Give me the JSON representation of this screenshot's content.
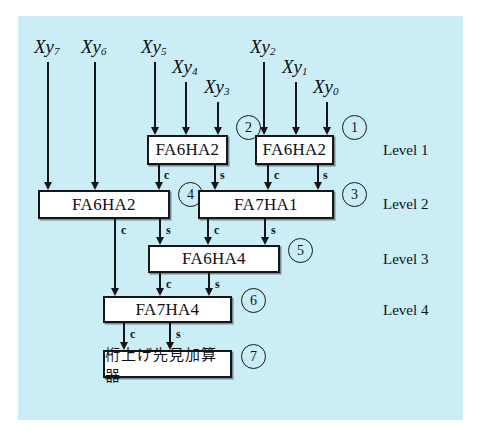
{
  "figure": {
    "background_color": "#cbeef6",
    "panel_border_color": "#ffffff",
    "line_color": "#15151a",
    "box_fill": "#ffffff"
  },
  "inputs": [
    {
      "id": "xy7",
      "label_x": "X",
      "label_y": "y",
      "sub": "7",
      "x": 48,
      "label_top": 36,
      "arrow_top": 62,
      "arrow_bottom": 190
    },
    {
      "id": "xy6",
      "label_x": "X",
      "label_y": "y",
      "sub": "6",
      "x": 95,
      "label_top": 36,
      "arrow_top": 62,
      "arrow_bottom": 190
    },
    {
      "id": "xy5",
      "label_x": "X",
      "label_y": "y",
      "sub": "5",
      "x": 155,
      "label_top": 36,
      "arrow_top": 62,
      "arrow_bottom": 135
    },
    {
      "id": "xy4",
      "label_x": "X",
      "label_y": "y",
      "sub": "4",
      "x": 186,
      "label_top": 56,
      "arrow_top": 82,
      "arrow_bottom": 135
    },
    {
      "id": "xy3",
      "label_x": "X",
      "label_y": "y",
      "sub": "3",
      "x": 218,
      "label_top": 76,
      "arrow_top": 102,
      "arrow_bottom": 135
    },
    {
      "id": "xy2",
      "label_x": "X",
      "label_y": "y",
      "sub": "2",
      "x": 264,
      "label_top": 36,
      "arrow_top": 62,
      "arrow_bottom": 135
    },
    {
      "id": "xy1",
      "label_x": "X",
      "label_y": "y",
      "sub": "1",
      "x": 296,
      "label_top": 56,
      "arrow_top": 82,
      "arrow_bottom": 135
    },
    {
      "id": "xy0",
      "label_x": "X",
      "label_y": "y",
      "sub": "0",
      "x": 327,
      "label_top": 76,
      "arrow_top": 102,
      "arrow_bottom": 135
    }
  ],
  "blocks": [
    {
      "id": "b2",
      "label": "FA6HA2",
      "left": 147,
      "top": 135,
      "width": 81,
      "height": 30,
      "marker": "②",
      "marker_left": 236,
      "marker_top": 115
    },
    {
      "id": "b1",
      "label": "FA6HA2",
      "left": 255,
      "top": 135,
      "width": 79,
      "height": 30,
      "marker": "①",
      "marker_left": 342,
      "marker_top": 115
    },
    {
      "id": "b4",
      "label": "FA6HA2",
      "left": 38,
      "top": 190,
      "width": 132,
      "height": 29,
      "marker": "④",
      "marker_left": 178,
      "marker_top": 182
    },
    {
      "id": "b3",
      "label": "FA7HA1",
      "left": 198,
      "top": 190,
      "width": 136,
      "height": 29,
      "marker": "③",
      "marker_left": 342,
      "marker_top": 182
    },
    {
      "id": "b5",
      "label": "FA6HA4",
      "left": 148,
      "top": 245,
      "width": 132,
      "height": 28,
      "marker": "⑤",
      "marker_left": 288,
      "marker_top": 238
    },
    {
      "id": "b6",
      "label": "FA7HA4",
      "left": 103,
      "top": 296,
      "width": 129,
      "height": 27,
      "marker": "⑥",
      "marker_left": 241,
      "marker_top": 288
    },
    {
      "id": "b7",
      "label": "桁上げ先見加算器",
      "left": 103,
      "top": 350,
      "width": 129,
      "height": 28,
      "marker": "⑦",
      "marker_left": 241,
      "marker_top": 344
    }
  ],
  "signal_labels": {
    "carry": "c",
    "sum": "s"
  },
  "edges": [
    {
      "from": "b2",
      "port": "c",
      "x": 159,
      "top": 165,
      "bottom": 190,
      "label": "c",
      "label_left": 164,
      "label_top": 168
    },
    {
      "from": "b2",
      "port": "s",
      "x": 215,
      "top": 165,
      "bottom": 190,
      "label": "s",
      "label_left": 220,
      "label_top": 168
    },
    {
      "from": "b1",
      "port": "c",
      "x": 268,
      "top": 165,
      "bottom": 190,
      "label": "c",
      "label_left": 274,
      "label_top": 168
    },
    {
      "from": "b1",
      "port": "s",
      "x": 318,
      "top": 165,
      "bottom": 190,
      "label": "s",
      "label_left": 323,
      "label_top": 168
    },
    {
      "from": "b4",
      "port": "c",
      "x": 115,
      "top": 219,
      "bottom": 296,
      "label": "c",
      "label_left": 121,
      "label_top": 223
    },
    {
      "from": "b4",
      "port": "s",
      "x": 160,
      "top": 219,
      "bottom": 245,
      "label": "s",
      "label_left": 166,
      "label_top": 223
    },
    {
      "from": "b3",
      "port": "c",
      "x": 208,
      "top": 219,
      "bottom": 245,
      "label": "c",
      "label_left": 214,
      "label_top": 223
    },
    {
      "from": "b3",
      "port": "s",
      "x": 265,
      "top": 219,
      "bottom": 245,
      "label": "s",
      "label_left": 271,
      "label_top": 223
    },
    {
      "from": "b5",
      "port": "c",
      "x": 160,
      "top": 273,
      "bottom": 296,
      "label": "c",
      "label_left": 166,
      "label_top": 277
    },
    {
      "from": "b5",
      "port": "s",
      "x": 209,
      "top": 273,
      "bottom": 296,
      "label": "s",
      "label_left": 215,
      "label_top": 277
    },
    {
      "from": "b6",
      "port": "c",
      "x": 124,
      "top": 323,
      "bottom": 350,
      "label": "c",
      "label_left": 130,
      "label_top": 327
    },
    {
      "from": "b6",
      "port": "s",
      "x": 170,
      "top": 323,
      "bottom": 350,
      "label": "s",
      "label_left": 176,
      "label_top": 327
    }
  ],
  "levels": [
    {
      "label": "Level 1",
      "left": 383,
      "top": 142
    },
    {
      "label": "Level 2",
      "left": 383,
      "top": 196
    },
    {
      "label": "Level 3",
      "left": 383,
      "top": 251
    },
    {
      "label": "Level 4",
      "left": 383,
      "top": 302
    }
  ]
}
